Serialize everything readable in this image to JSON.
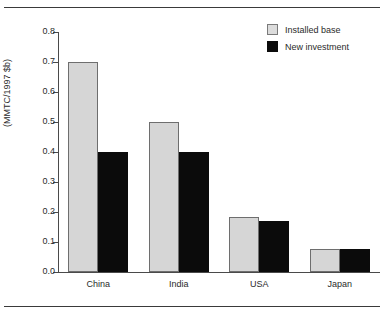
{
  "chart_data": {
    "type": "bar",
    "title": "",
    "subtitle": "",
    "xlabel": "",
    "ylabel": "(MMTC/1997 $b)",
    "categories": [
      "China",
      "India",
      "USA",
      "Japan"
    ],
    "series": [
      {
        "name": "Installed base",
        "color": "#d6d6d6",
        "values": [
          0.7,
          0.5,
          0.185,
          0.077
        ]
      },
      {
        "name": "New investment",
        "color": "#0b0b0b",
        "values": [
          0.4,
          0.4,
          0.17,
          0.077
        ]
      }
    ],
    "ylim": [
      0.0,
      0.8
    ],
    "ytick_labels": [
      "0.0",
      "0.1",
      "0.2",
      "0.3",
      "0.4",
      "0.5",
      "0.6",
      "0.7",
      "0.8"
    ],
    "ytick_values": [
      0.0,
      0.1,
      0.2,
      0.3,
      0.4,
      0.5,
      0.6,
      0.7,
      0.8
    ],
    "grid": false,
    "legend_position": "top-right"
  },
  "legend": {
    "items": [
      {
        "label": "Installed base",
        "swatch": "light"
      },
      {
        "label": "New investment",
        "swatch": "dark"
      }
    ]
  },
  "colors": {
    "installed_base": "#d6d6d6",
    "new_investment": "#0b0b0b",
    "axis": "#4a4a4a",
    "rule": "#3a3a3a",
    "text": "#2b2b2b"
  }
}
